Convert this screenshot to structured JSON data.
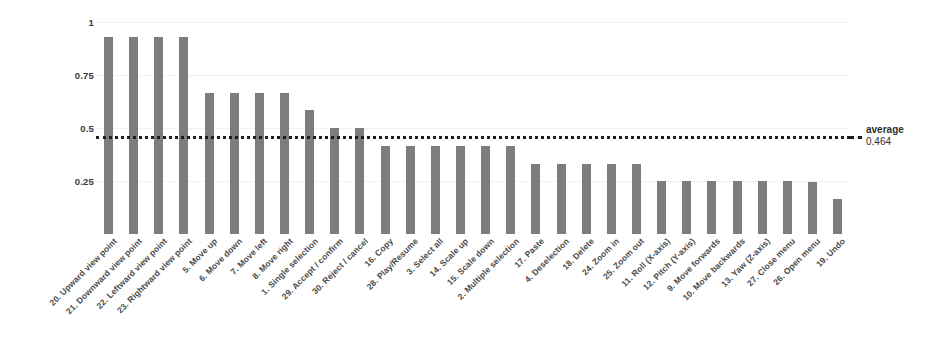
{
  "chart_data": {
    "type": "bar",
    "title": "",
    "xlabel": "",
    "ylabel": "",
    "ylim": [
      0,
      1
    ],
    "grid": true,
    "legend": "none",
    "orientation": "vertical",
    "bar_color": "#7d7d7d",
    "y_ticks": [
      "1",
      "0.75",
      "0.5",
      "0.25"
    ],
    "y_tick_values": [
      1,
      0.75,
      0.5,
      0.25
    ],
    "categories": [
      "20. Upward view point",
      "21. Downward view point",
      "22. Leftward view point",
      "23. Rightward view point",
      "5. Move up",
      "6. Move down",
      "7. Move left",
      "8. Move right",
      "1. Single selection",
      "29. Accept / confirm",
      "30. Reject / cancel",
      "16. Copy",
      "28. Play/Resume",
      "3. Select all",
      "14. Scale up",
      "15. Scale down",
      "2. Multiple selection",
      "17. Paste",
      "4. Deselection",
      "18. Delete",
      "24. Zoom in",
      "25. Zoom out",
      "11. Roll (X-axis)",
      "12. Pitch (Y-axis)",
      "9. Move forwards",
      "10. Move backwards",
      "13. Yaw (Z-axis)",
      "27. Close menu",
      "26. Open menu",
      "19. Undo"
    ],
    "values": [
      0.93,
      0.93,
      0.93,
      0.93,
      0.665,
      0.665,
      0.665,
      0.665,
      0.585,
      0.5,
      0.5,
      0.415,
      0.415,
      0.415,
      0.415,
      0.415,
      0.415,
      0.33,
      0.33,
      0.33,
      0.33,
      0.33,
      0.25,
      0.25,
      0.25,
      0.25,
      0.25,
      0.25,
      0.245,
      0.165
    ],
    "annotations": {
      "average_label": "average",
      "average_value": "0.464",
      "average_line": 0.464
    }
  }
}
